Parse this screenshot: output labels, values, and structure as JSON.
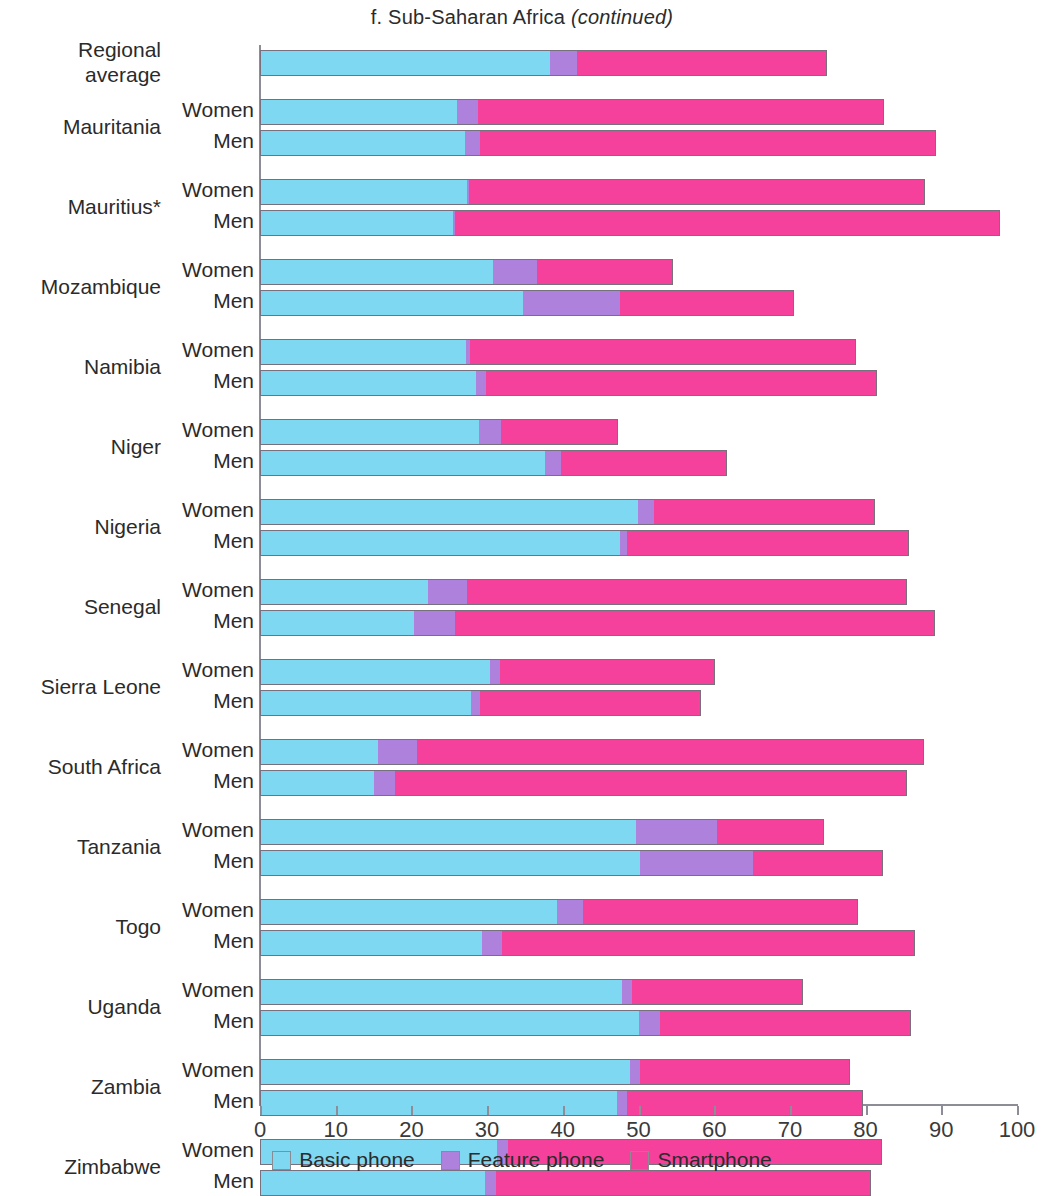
{
  "title": {
    "prefix": "f. Sub-Saharan Africa ",
    "suffix": "(continued)",
    "full": "f. Sub-Saharan Africa (continued)"
  },
  "colors": {
    "basic_phone": "#7FD8F2",
    "feature_phone": "#AE82DC",
    "smartphone": "#F5419B",
    "axis": "#8D8D97",
    "outline": "#77707F"
  },
  "legend": {
    "position": "bottom-center",
    "items": [
      {
        "label": "Basic phone",
        "color": "#7FD8F2"
      },
      {
        "label": "Feature phone",
        "color": "#AE82DC"
      },
      {
        "label": "Smartphone",
        "color": "#F5419B"
      }
    ]
  },
  "axis": {
    "ticks": [
      {
        "value": 0,
        "label": "0"
      },
      {
        "value": 10,
        "label": "10"
      },
      {
        "value": 20,
        "label": "20"
      },
      {
        "value": 30,
        "label": "30"
      },
      {
        "value": 40,
        "label": "40"
      },
      {
        "value": 50,
        "label": "50"
      },
      {
        "value": 60,
        "label": "60"
      },
      {
        "value": 70,
        "label": "70"
      },
      {
        "value": 80,
        "label": "80"
      },
      {
        "value": 90,
        "label": "90"
      },
      {
        "value": 100,
        "label": "100"
      }
    ]
  },
  "series_labels": {
    "women": "Women",
    "men": "Men"
  },
  "chart_data": {
    "type": "bar",
    "orientation": "horizontal",
    "stacked": true,
    "title": "f. Sub-Saharan Africa (continued)",
    "xlabel": "",
    "ylabel": "",
    "xlim": [
      0,
      100
    ],
    "xticks": [
      0,
      10,
      20,
      30,
      40,
      50,
      60,
      70,
      80,
      90,
      100
    ],
    "grid": false,
    "legend_position": "bottom-center",
    "stack_order": [
      "Basic phone",
      "Feature phone",
      "Smartphone"
    ],
    "series": [
      {
        "name": "Basic phone",
        "color": "#7FD8F2"
      },
      {
        "name": "Feature phone",
        "color": "#AE82DC"
      },
      {
        "name": "Smartphone",
        "color": "#F5419B"
      }
    ],
    "groups": [
      {
        "category": "Regional\naverage",
        "single_row": true,
        "rows": [
          {
            "label": "",
            "basic_phone": 38.3,
            "feature_phone": 3.6,
            "smartphone": 33.0,
            "total": 74.9
          }
        ]
      },
      {
        "category": "Mauritania",
        "rows": [
          {
            "label": "Women",
            "basic_phone": 26.0,
            "feature_phone": 2.8,
            "smartphone": 53.6,
            "total": 82.4
          },
          {
            "label": "Men",
            "basic_phone": 27.1,
            "feature_phone": 2.0,
            "smartphone": 60.2,
            "total": 89.3
          }
        ]
      },
      {
        "category": "Mauritius*",
        "rows": [
          {
            "label": "Women",
            "basic_phone": 27.3,
            "feature_phone": 0.3,
            "smartphone": 60.2,
            "total": 87.8
          },
          {
            "label": "Men",
            "basic_phone": 25.5,
            "feature_phone": 0.3,
            "smartphone": 72.0,
            "total": 97.8
          }
        ]
      },
      {
        "category": "Mozambique",
        "rows": [
          {
            "label": "Women",
            "basic_phone": 30.8,
            "feature_phone": 5.8,
            "smartphone": 18.0,
            "total": 54.6
          },
          {
            "label": "Men",
            "basic_phone": 34.7,
            "feature_phone": 12.9,
            "smartphone": 22.9,
            "total": 70.5
          }
        ]
      },
      {
        "category": "Namibia",
        "rows": [
          {
            "label": "Women",
            "basic_phone": 27.2,
            "feature_phone": 0.5,
            "smartphone": 51.1,
            "total": 78.8
          },
          {
            "label": "Men",
            "basic_phone": 28.5,
            "feature_phone": 1.3,
            "smartphone": 51.7,
            "total": 81.5
          }
        ]
      },
      {
        "category": "Niger",
        "rows": [
          {
            "label": "Women",
            "basic_phone": 28.9,
            "feature_phone": 3.0,
            "smartphone": 15.4,
            "total": 47.3
          },
          {
            "label": "Men",
            "basic_phone": 37.6,
            "feature_phone": 2.1,
            "smartphone": 22.0,
            "total": 61.7
          }
        ]
      },
      {
        "category": "Nigeria",
        "rows": [
          {
            "label": "Women",
            "basic_phone": 49.9,
            "feature_phone": 2.1,
            "smartphone": 29.2,
            "total": 81.2
          },
          {
            "label": "Men",
            "basic_phone": 47.5,
            "feature_phone": 1.0,
            "smartphone": 37.3,
            "total": 85.8
          }
        ]
      },
      {
        "category": "Senegal",
        "rows": [
          {
            "label": "Women",
            "basic_phone": 22.2,
            "feature_phone": 5.1,
            "smartphone": 58.2,
            "total": 85.5
          },
          {
            "label": "Men",
            "basic_phone": 20.3,
            "feature_phone": 5.5,
            "smartphone": 63.4,
            "total": 89.2
          }
        ]
      },
      {
        "category": "Sierra Leone",
        "rows": [
          {
            "label": "Women",
            "basic_phone": 30.4,
            "feature_phone": 1.3,
            "smartphone": 28.4,
            "total": 60.1
          },
          {
            "label": "Men",
            "basic_phone": 27.9,
            "feature_phone": 1.1,
            "smartphone": 29.2,
            "total": 58.2
          }
        ]
      },
      {
        "category": "South Africa",
        "rows": [
          {
            "label": "Women",
            "basic_phone": 15.6,
            "feature_phone": 5.2,
            "smartphone": 66.9,
            "total": 87.7
          },
          {
            "label": "Men",
            "basic_phone": 15.1,
            "feature_phone": 2.7,
            "smartphone": 67.7,
            "total": 85.5
          }
        ]
      },
      {
        "category": "Tanzania",
        "rows": [
          {
            "label": "Women",
            "basic_phone": 49.7,
            "feature_phone": 10.7,
            "smartphone": 14.1,
            "total": 74.5
          },
          {
            "label": "Men",
            "basic_phone": 50.2,
            "feature_phone": 14.9,
            "smartphone": 17.2,
            "total": 82.3
          }
        ]
      },
      {
        "category": "Togo",
        "rows": [
          {
            "label": "Women",
            "basic_phone": 39.2,
            "feature_phone": 3.5,
            "smartphone": 36.3,
            "total": 79.0
          },
          {
            "label": "Men",
            "basic_phone": 29.3,
            "feature_phone": 2.7,
            "smartphone": 54.5,
            "total": 86.5
          }
        ]
      },
      {
        "category": "Uganda",
        "rows": [
          {
            "label": "Women",
            "basic_phone": 47.8,
            "feature_phone": 1.4,
            "smartphone": 22.5,
            "total": 71.7
          },
          {
            "label": "Men",
            "basic_phone": 50.1,
            "feature_phone": 2.7,
            "smartphone": 33.2,
            "total": 86.0
          }
        ]
      },
      {
        "category": "Zambia",
        "rows": [
          {
            "label": "Women",
            "basic_phone": 48.9,
            "feature_phone": 1.3,
            "smartphone": 27.7,
            "total": 77.9
          },
          {
            "label": "Men",
            "basic_phone": 47.2,
            "feature_phone": 1.3,
            "smartphone": 31.2,
            "total": 79.7
          }
        ]
      },
      {
        "category": "Zimbabwe",
        "rows": [
          {
            "label": "Women",
            "basic_phone": 31.3,
            "feature_phone": 1.4,
            "smartphone": 49.5,
            "total": 82.2
          },
          {
            "label": "Men",
            "basic_phone": 29.7,
            "feature_phone": 1.5,
            "smartphone": 49.5,
            "total": 80.7
          }
        ]
      }
    ]
  }
}
